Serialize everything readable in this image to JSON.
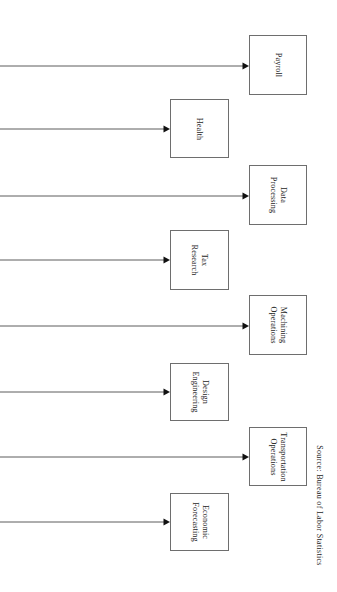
{
  "figure": {
    "background_color": "#ffffff",
    "line_color": "#4a4a4a",
    "box_border_color": "#6e6e6e",
    "text_color": "#1d1d1d",
    "text_orientation": "rotated-90-clockwise",
    "source_note": "Source:  Bureau  of  Labor  Statistics"
  },
  "nodes": [
    {
      "id": "payroll",
      "label": "Payroll",
      "lines": [
        "Payroll"
      ],
      "column": "right",
      "x": 249,
      "y": 35,
      "w": 58,
      "h": 60
    },
    {
      "id": "health",
      "label": "Health",
      "lines": [
        "Health"
      ],
      "column": "left",
      "x": 170,
      "y": 99,
      "w": 59,
      "h": 59
    },
    {
      "id": "data-processing",
      "label": "Data Processing",
      "lines": [
        "Data",
        "Processing"
      ],
      "column": "right",
      "x": 249,
      "y": 165,
      "w": 58,
      "h": 60
    },
    {
      "id": "tax-research",
      "label": "Tax Research",
      "lines": [
        "Tax",
        "Research"
      ],
      "column": "left",
      "x": 170,
      "y": 230,
      "w": 59,
      "h": 60
    },
    {
      "id": "machining-operations",
      "label": "Machining Operations",
      "lines": [
        "Machining",
        "Operations"
      ],
      "column": "right",
      "x": 249,
      "y": 295,
      "w": 58,
      "h": 60
    },
    {
      "id": "design-engineering",
      "label": "Design Engineering",
      "lines": [
        "Design",
        "Engineering"
      ],
      "column": "left",
      "x": 170,
      "y": 363,
      "w": 59,
      "h": 58
    },
    {
      "id": "transportation-operations",
      "label": "Transportation Operations",
      "lines": [
        "Transportation",
        "Operations"
      ],
      "column": "right",
      "x": 249,
      "y": 427,
      "w": 58,
      "h": 59
    },
    {
      "id": "economic-forecasting",
      "label": "Economic Forecasting",
      "lines": [
        "Economic",
        "Forecasting"
      ],
      "column": "left",
      "x": 170,
      "y": 493,
      "w": 59,
      "h": 58
    }
  ],
  "arrows": [
    {
      "id": "arrow-payroll",
      "target": "payroll",
      "x_start": 0,
      "x_end": 249,
      "y": 66
    },
    {
      "id": "arrow-health",
      "target": "health",
      "x_start": 0,
      "x_end": 170,
      "y": 129
    },
    {
      "id": "arrow-data-processing",
      "target": "data-processing",
      "x_start": 0,
      "x_end": 249,
      "y": 196
    },
    {
      "id": "arrow-tax-research",
      "target": "tax-research",
      "x_start": 0,
      "x_end": 170,
      "y": 260
    },
    {
      "id": "arrow-machining-operations",
      "target": "machining-operations",
      "x_start": 0,
      "x_end": 249,
      "y": 326
    },
    {
      "id": "arrow-design-engineering",
      "target": "design-engineering",
      "x_start": 0,
      "x_end": 170,
      "y": 392
    },
    {
      "id": "arrow-transportation-operations",
      "target": "transportation-operations",
      "x_start": 0,
      "x_end": 249,
      "y": 457
    },
    {
      "id": "arrow-economic-forecasting",
      "target": "economic-forecasting",
      "x_start": 0,
      "x_end": 170,
      "y": 522
    }
  ],
  "chart_data": {
    "type": "diagram",
    "title": "",
    "categories": [
      "Payroll",
      "Health",
      "Data Processing",
      "Tax Research",
      "Machining Operations",
      "Design Engineering",
      "Transportation Operations",
      "Economic Forecasting"
    ],
    "annotations": [
      "Source:  Bureau  of  Labor  Statistics"
    ],
    "legend": []
  }
}
